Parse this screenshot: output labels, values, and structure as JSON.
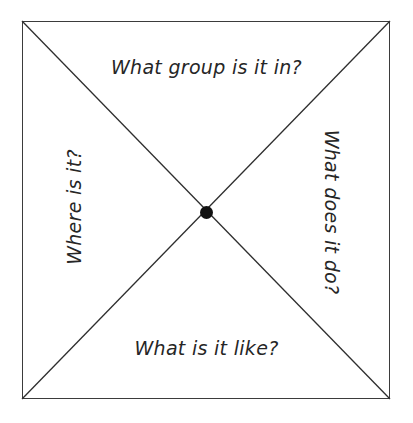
{
  "diagram": {
    "type": "concept-definition-map",
    "shape": "square-with-diagonals",
    "center_marker": "filled-dot",
    "colors": {
      "line": "#3b3b3b",
      "diagonal": "#2e2e2e",
      "dot": "#111111",
      "text": "#262626",
      "background": "#ffffff"
    },
    "quadrant_labels": {
      "top": "What group is it in?",
      "right": "What does it do?",
      "bottom": "What is it like?",
      "left": "Where is it?"
    },
    "label_rotation": {
      "top": "0",
      "right": "90",
      "bottom": "0",
      "left": "-90"
    }
  }
}
